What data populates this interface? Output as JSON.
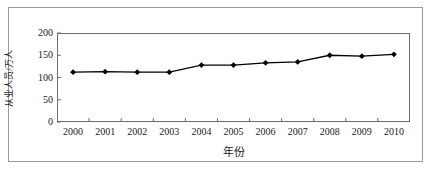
{
  "chart_data": {
    "type": "line",
    "title": "",
    "xlabel": "年份",
    "ylabel": "从业人员/万人",
    "categories": [
      "2000",
      "2001",
      "2002",
      "2003",
      "2004",
      "2005",
      "2006",
      "2007",
      "2008",
      "2009",
      "2010"
    ],
    "values": [
      112,
      113,
      112,
      112,
      128,
      128,
      133,
      135,
      150,
      148,
      152
    ],
    "series": [
      {
        "name": "从业人员",
        "values": [
          112,
          113,
          112,
          112,
          128,
          128,
          133,
          135,
          150,
          148,
          152
        ]
      }
    ],
    "ylim": [
      0,
      200
    ],
    "yticks": [
      0,
      50,
      100,
      150,
      200
    ],
    "ytick_labels": [
      "0",
      "50",
      "100",
      "150",
      "200"
    ],
    "xtick_labels": [
      "2000",
      "2001",
      "2002",
      "2003",
      "2004",
      "2005",
      "2006",
      "2007",
      "2008",
      "2009",
      "2010"
    ],
    "grid": false,
    "legend": "none",
    "marker": "diamond",
    "line_color": "#000000",
    "marker_color": "#000000",
    "axis_color": "#6d6d6d",
    "frame_color": "#9a9a9a",
    "background": "#ffffff"
  },
  "axis": {
    "y_labels": [
      "200",
      "150",
      "100",
      "50",
      "0"
    ],
    "y_title": "从业人员/万人",
    "x_title": "年份"
  }
}
